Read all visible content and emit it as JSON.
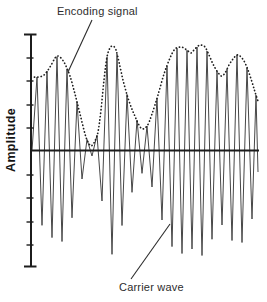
{
  "chart_data": {
    "type": "line",
    "ylabel": "Amplitude",
    "xlabel": "",
    "labels": {
      "encoding": "Encoding signal",
      "carrier": "Carrier wave"
    },
    "colors": {
      "background": "#ffffff",
      "axis_ink": "#1c1c1c",
      "carrier_ink": "#474747",
      "envelope_ink": "#1f1f1f",
      "leader_ink": "#2b2b2b"
    },
    "axes": {
      "y_axis_x": 31,
      "y_top": 34.5,
      "y_bottom": 266.5,
      "baseline_y": 150.5,
      "x_right": 259,
      "tick_ys": [
        58,
        81,
        105,
        128,
        175,
        198,
        222,
        245
      ],
      "tick_x1": 26.5,
      "tick_x2": 33.5,
      "cap_x1": 24,
      "cap_x2": 36.5,
      "grid": false
    },
    "carrier": {
      "period": 10,
      "first_peak_x": 37,
      "start_x": 32,
      "last_vertex_x": 252,
      "tail_peak_x": 256,
      "tail_end": [
        258,
        172
      ]
    },
    "envelope_points": [
      [
        31,
        77
      ],
      [
        38,
        77
      ],
      [
        44,
        75
      ],
      [
        50,
        67
      ],
      [
        55,
        58
      ],
      [
        58,
        56
      ],
      [
        61,
        58
      ],
      [
        65,
        64
      ],
      [
        70,
        76
      ],
      [
        75,
        94
      ],
      [
        80,
        114
      ],
      [
        85,
        134
      ],
      [
        88,
        142
      ],
      [
        91,
        146
      ],
      [
        93,
        144
      ],
      [
        95,
        141
      ],
      [
        98,
        132
      ],
      [
        101,
        110
      ],
      [
        104,
        80
      ],
      [
        107,
        57
      ],
      [
        110,
        48
      ],
      [
        113,
        46
      ],
      [
        116,
        50
      ],
      [
        119,
        62
      ],
      [
        123,
        80
      ],
      [
        128,
        98
      ],
      [
        134,
        114
      ],
      [
        141,
        128
      ],
      [
        147,
        126
      ],
      [
        152,
        114
      ],
      [
        158,
        95
      ],
      [
        164,
        74
      ],
      [
        170,
        58
      ],
      [
        175,
        49
      ],
      [
        180,
        47
      ],
      [
        184,
        48
      ],
      [
        188,
        51
      ],
      [
        191,
        53
      ],
      [
        194,
        50
      ],
      [
        198,
        46
      ],
      [
        201,
        45
      ],
      [
        205,
        47
      ],
      [
        209,
        55
      ],
      [
        213,
        64
      ],
      [
        217,
        71
      ],
      [
        220,
        75
      ],
      [
        222,
        76
      ],
      [
        225,
        73
      ],
      [
        229,
        65
      ],
      [
        233,
        59
      ],
      [
        237,
        55
      ],
      [
        240,
        56
      ],
      [
        244,
        61
      ],
      [
        248,
        70
      ],
      [
        252,
        82
      ],
      [
        255,
        92
      ],
      [
        258,
        101
      ]
    ],
    "annotations": {
      "encoding_leader": [
        92,
        20,
        68,
        72
      ],
      "carrier_leader": [
        131,
        279,
        170,
        224
      ]
    }
  }
}
